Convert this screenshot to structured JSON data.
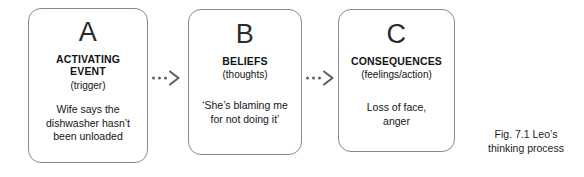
{
  "figure": {
    "caption_line1": "Fig. 7.1 Leo’s",
    "caption_line2": "thinking process",
    "background": "#ffffff",
    "box_border_color": "#8a8a8a",
    "text_color": "#141414"
  },
  "boxes": [
    {
      "letter": "A",
      "title_line1": "ACTIVATING",
      "title_line2": "EVENT",
      "subtitle": "(trigger)",
      "detail_line1": "Wife says the",
      "detail_line2": "dishwasher hasn’t",
      "detail_line3": "been unloaded"
    },
    {
      "letter": "B",
      "title_line1": "BELIEFS",
      "title_line2": "",
      "subtitle": "(thoughts)",
      "detail_line1": "‘She’s blaming me",
      "detail_line2": "for not doing it’",
      "detail_line3": ""
    },
    {
      "letter": "C",
      "title_line1": "CONSEQUENCES",
      "title_line2": "",
      "subtitle": "(feelings/action)",
      "detail_line1": "Loss of face,",
      "detail_line2": "anger",
      "detail_line3": ""
    }
  ],
  "connectors": [
    {
      "name": "arrow-a-to-b",
      "style": "dashed-arrow",
      "glyph": "-->"
    },
    {
      "name": "arrow-b-to-c",
      "style": "dashed-arrow",
      "glyph": "-->"
    }
  ]
}
